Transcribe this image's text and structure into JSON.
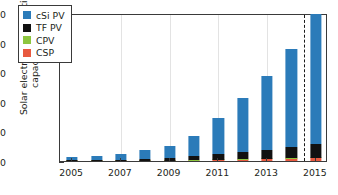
{
  "chart_data": {
    "type": "bar",
    "stacked": true,
    "title": "",
    "xlabel": "",
    "ylabel": "Solar electricity generation\ncapacity [GWp]",
    "ylim": [
      0,
      250
    ],
    "yticks": [
      0,
      50,
      100,
      150,
      200,
      250
    ],
    "ytick_labels": [
      "0",
      "50",
      "100",
      "150",
      "200",
      "250"
    ],
    "yminor_step": 10,
    "grid": "vertical",
    "legend_position": "upper-left",
    "categories": [
      "2005",
      "2006",
      "2007",
      "2008",
      "2009",
      "2010",
      "2011",
      "2012",
      "2013",
      "2014",
      "2015"
    ],
    "xtick_labels": [
      "2005",
      "",
      "2007",
      "",
      "2009",
      "",
      "2011",
      "",
      "2013",
      "",
      "2015"
    ],
    "series": [
      {
        "name": "CSP",
        "color": "#e8593f",
        "values": [
          0.4,
          0.4,
          0.5,
          0.6,
          0.7,
          1.3,
          1.8,
          2.6,
          3.4,
          4.4,
          5.0
        ]
      },
      {
        "name": "CPV",
        "color": "#8dc63f",
        "values": [
          0.02,
          0.02,
          0.03,
          0.05,
          0.1,
          0.2,
          0.3,
          0.4,
          0.5,
          0.6,
          0.7
        ]
      },
      {
        "name": "TF PV",
        "color": "#111111",
        "values": [
          0.8,
          1.2,
          1.8,
          3.0,
          4.5,
          6.5,
          9.0,
          12.5,
          15.0,
          19.0,
          23.0
        ]
      },
      {
        "name": "cSi PV",
        "color": "#2b7bb9",
        "values": [
          4.8,
          6.4,
          9.5,
          14.8,
          20.5,
          35.0,
          61.5,
          90.5,
          124.5,
          166.0,
          219.0
        ]
      }
    ],
    "totals": [
      6,
      8,
      12,
      18.5,
      26,
      43,
      72.5,
      106,
      143.5,
      190,
      248
    ],
    "annotation": {
      "type": "dashed-vline",
      "between": [
        "2014",
        "2015"
      ],
      "label": ""
    }
  },
  "legend": {
    "items": [
      {
        "label": "cSi PV",
        "color": "#2b7bb9"
      },
      {
        "label": "TF PV",
        "color": "#111111"
      },
      {
        "label": "CPV",
        "color": "#8dc63f"
      },
      {
        "label": "CSP",
        "color": "#e8593f"
      }
    ]
  }
}
